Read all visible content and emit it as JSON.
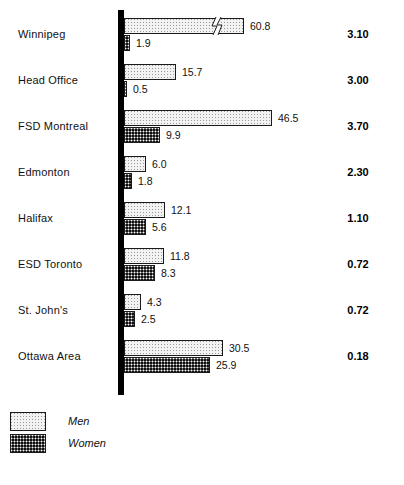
{
  "chart_data": {
    "type": "bar",
    "orientation": "horizontal",
    "title": "",
    "subtitle": "",
    "xlabel": "",
    "ylabel": "",
    "grid": false,
    "legend_position": "bottom-left",
    "axis_note": "Winnipeg Men bar is truncated with an axis-break (zigzag) symbol",
    "pixels_per_unit": 3.3,
    "categories": [
      "Winnipeg",
      "Head Office",
      "FSD Montreal",
      "Edmonton",
      "Halifax",
      "ESD Toronto",
      "St. John's",
      "Ottawa Area"
    ],
    "series": [
      {
        "name": "Men",
        "values": [
          60.8,
          15.7,
          46.5,
          6.0,
          12.1,
          11.8,
          4.3,
          30.5
        ],
        "labels": [
          "60.8",
          "15.7",
          "46.5",
          "6.0",
          "12.1",
          "11.8",
          "4.3",
          "30.5"
        ]
      },
      {
        "name": "Women",
        "values": [
          1.9,
          0.5,
          9.9,
          1.8,
          5.6,
          8.3,
          2.5,
          25.9
        ],
        "labels": [
          "1.9",
          "0.5",
          "9.9",
          "1.8",
          "5.6",
          "8.3",
          "2.5",
          "25.9"
        ]
      }
    ],
    "ratio_column": {
      "values": [
        "3.10",
        "3.00",
        "3.70",
        "2.30",
        "1.10",
        "0.72",
        "0.72",
        "0.18"
      ]
    },
    "broken_bars": [
      {
        "category": "Winnipeg",
        "series": "Men",
        "drawn_length_units": 36.5
      }
    ]
  },
  "rows": [
    {
      "label": "Winnipeg",
      "men": "60.8",
      "women": "1.9",
      "ratio": "3.10",
      "men_px": 120,
      "women_px": 6,
      "broken": true
    },
    {
      "label": "Head Office",
      "men": "15.7",
      "women": "0.5",
      "ratio": "3.00",
      "men_px": 52,
      "women_px": 3,
      "broken": false
    },
    {
      "label": "FSD Montreal",
      "men": "46.5",
      "women": "9.9",
      "ratio": "3.70",
      "men_px": 148,
      "women_px": 36,
      "broken": false
    },
    {
      "label": "Edmonton",
      "men": "6.0",
      "women": "1.8",
      "ratio": "2.30",
      "men_px": 22,
      "women_px": 8,
      "broken": false
    },
    {
      "label": "Halifax",
      "men": "12.1",
      "women": "5.6",
      "ratio": "1.10",
      "men_px": 41,
      "women_px": 22,
      "broken": false
    },
    {
      "label": "ESD Toronto",
      "men": "11.8",
      "women": "8.3",
      "ratio": "0.72",
      "men_px": 40,
      "women_px": 31,
      "broken": false
    },
    {
      "label": "St. John's",
      "men": "4.3",
      "women": "2.5",
      "ratio": "0.72",
      "men_px": 17,
      "women_px": 11,
      "broken": false
    },
    {
      "label": "Ottawa Area",
      "men": "30.5",
      "women": "25.9",
      "ratio": "0.18",
      "men_px": 99,
      "women_px": 86,
      "broken": false
    }
  ],
  "legend": {
    "items": [
      {
        "label": "Men",
        "swatch": "light-stipple-swatch"
      },
      {
        "label": "Women",
        "swatch": "dark-checker-swatch"
      }
    ]
  }
}
